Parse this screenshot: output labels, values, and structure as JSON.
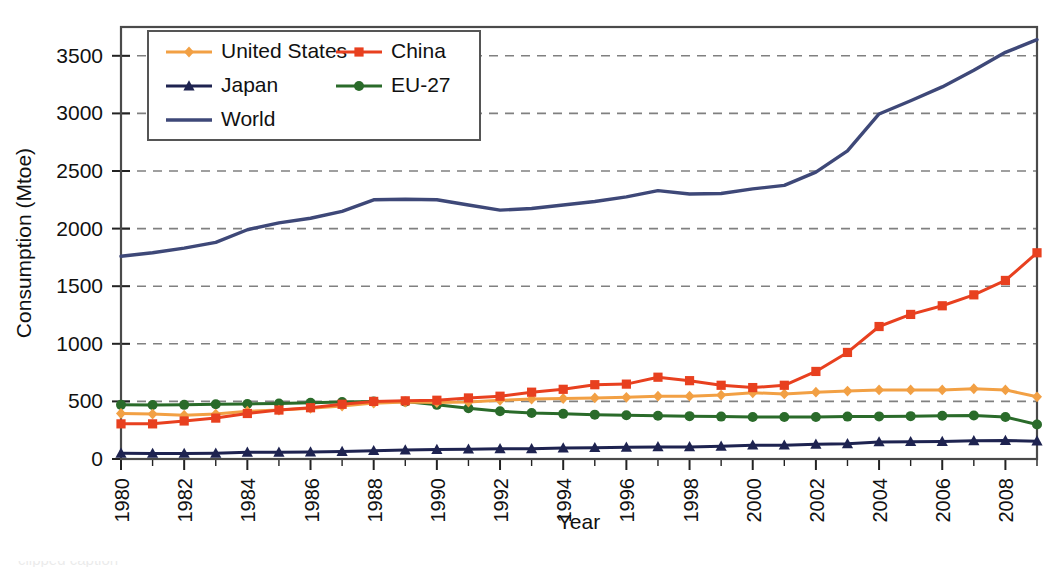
{
  "chart_data": {
    "type": "line",
    "title": "",
    "xlabel": "Year",
    "ylabel": "Consumption (Mtoe)",
    "xlim": [
      1980,
      2009
    ],
    "ylim": [
      0,
      3750
    ],
    "yticks": [
      0,
      500,
      1000,
      1500,
      2000,
      2500,
      3000,
      3500
    ],
    "ytick_labels": [
      "0",
      "500",
      "1000",
      "1500",
      "2000",
      "2500",
      "3000",
      "3500"
    ],
    "xticks": [
      1980,
      1982,
      1984,
      1986,
      1988,
      1990,
      1992,
      1994,
      1996,
      1998,
      2000,
      2002,
      2004,
      2006,
      2008
    ],
    "xtick_labels": [
      "1980",
      "1982",
      "1984",
      "1986",
      "1988",
      "1990",
      "1992",
      "1994",
      "1996",
      "1998",
      "2000",
      "2002",
      "2004",
      "2006",
      "2008"
    ],
    "x": [
      1980,
      1981,
      1982,
      1983,
      1984,
      1985,
      1986,
      1987,
      1988,
      1989,
      1990,
      1991,
      1992,
      1993,
      1994,
      1995,
      1996,
      1997,
      1998,
      1999,
      2000,
      2001,
      2002,
      2003,
      2004,
      2005,
      2006,
      2007,
      2008,
      2009
    ],
    "grid": "horizontal-dashed",
    "legend_position": "top-left",
    "series": [
      {
        "name": "United States",
        "color": "#F2A044",
        "marker": "diamond",
        "values": [
          395,
          390,
          380,
          390,
          415,
          425,
          440,
          460,
          485,
          495,
          490,
          495,
          510,
          520,
          525,
          530,
          535,
          545,
          545,
          555,
          575,
          565,
          580,
          590,
          600,
          600,
          600,
          610,
          600,
          540
        ]
      },
      {
        "name": "China",
        "color": "#E8401F",
        "marker": "square",
        "values": [
          305,
          305,
          330,
          355,
          395,
          425,
          445,
          475,
          500,
          505,
          510,
          530,
          545,
          580,
          605,
          645,
          650,
          710,
          680,
          640,
          620,
          640,
          760,
          925,
          1150,
          1255,
          1330,
          1425,
          1550,
          1790
        ]
      },
      {
        "name": "Japan",
        "color": "#1E2350",
        "marker": "triangle",
        "values": [
          50,
          48,
          48,
          50,
          58,
          58,
          60,
          65,
          72,
          78,
          82,
          85,
          88,
          88,
          95,
          98,
          102,
          105,
          105,
          110,
          120,
          120,
          128,
          132,
          148,
          150,
          152,
          158,
          160,
          155
        ]
      },
      {
        "name": "EU-27",
        "color": "#2A6B2A",
        "marker": "circle",
        "values": [
          470,
          468,
          470,
          475,
          478,
          482,
          488,
          495,
          500,
          498,
          470,
          440,
          415,
          400,
          392,
          385,
          380,
          375,
          372,
          368,
          365,
          365,
          365,
          368,
          370,
          372,
          375,
          378,
          365,
          300
        ]
      },
      {
        "name": "World",
        "color": "#3E4878",
        "marker": "none",
        "values": [
          1760,
          1790,
          1830,
          1880,
          1990,
          2050,
          2090,
          2150,
          2250,
          2255,
          2250,
          2205,
          2160,
          2175,
          2205,
          2235,
          2275,
          2330,
          2300,
          2305,
          2345,
          2375,
          2490,
          2675,
          2995,
          3110,
          3230,
          3375,
          3530,
          3640
        ]
      }
    ]
  },
  "legend": {
    "entries": [
      {
        "label": "United States"
      },
      {
        "label": "China"
      },
      {
        "label": "Japan"
      },
      {
        "label": "EU-27"
      },
      {
        "label": "World"
      }
    ]
  },
  "footer": {
    "artifact_text": "clipped caption"
  }
}
